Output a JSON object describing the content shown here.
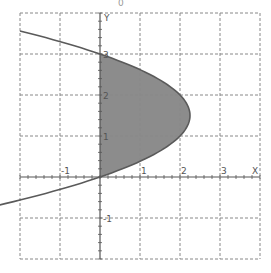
{
  "chart_data": {
    "type": "area",
    "title": "0",
    "xlabel": "X",
    "ylabel": "Y",
    "xlim": [
      -2,
      4
    ],
    "ylim": [
      -2,
      4
    ],
    "grid": true,
    "grid_style": "dashed",
    "x_ticks": [
      -1,
      1,
      2,
      3
    ],
    "y_ticks": [
      3,
      2,
      1,
      -1
    ],
    "x_tick_labels": [
      "-1",
      "1",
      "2",
      "3"
    ],
    "y_tick_labels": [
      "3",
      "2",
      "1",
      "-1"
    ],
    "minor_tick_step": 0.2,
    "curve": {
      "equation": "x = y(3 - y)",
      "points": [
        {
          "y": -0.56,
          "x": -2
        },
        {
          "y": 0,
          "x": 0
        },
        {
          "y": 0.5,
          "x": 1.25
        },
        {
          "y": 1,
          "x": 2
        },
        {
          "y": 1.5,
          "x": 2.25
        },
        {
          "y": 2,
          "x": 2
        },
        {
          "y": 2.5,
          "x": 1.25
        },
        {
          "y": 3,
          "x": 0
        },
        {
          "y": 3.56,
          "x": -2
        }
      ]
    },
    "shaded_region": {
      "description": "Region between x = 0 and x = y(3 - y) for 0 <= y <= 3",
      "y_range": [
        0,
        3
      ]
    },
    "colors": {
      "fill": "#8c8c8c",
      "curve": "#5a5a5a",
      "axis": "#555555",
      "grid": "#888888"
    }
  }
}
